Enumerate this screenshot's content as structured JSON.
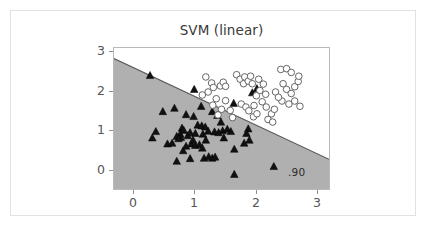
{
  "figure": {
    "background_color": "#ffffff",
    "frame_color": "#e2e2e2",
    "width": 427,
    "height": 227
  },
  "chart_data": {
    "type": "scatter",
    "title": "SVM (linear)",
    "subtitle": "",
    "xlabel": "",
    "ylabel": "",
    "xlim": [
      -0.45,
      3.25
    ],
    "ylim": [
      -0.6,
      3.15
    ],
    "xticks": [
      "0",
      "1",
      "2",
      "3"
    ],
    "xtick_values": [
      0,
      1,
      2,
      3
    ],
    "yticks": [
      "0",
      "1",
      "2",
      "3"
    ],
    "ytick_values": [
      0,
      1,
      2,
      3
    ],
    "grid": false,
    "legend": null,
    "annotations": [
      {
        "text": ".90",
        "x": 2.55,
        "y": -0.33,
        "role": "accuracy-score"
      }
    ],
    "decision_boundary": {
      "type": "line",
      "label": "linear decision boundary",
      "color": "#5a5a5a",
      "point_a": [
        -0.45,
        2.87
      ],
      "point_b": [
        3.25,
        0.19
      ],
      "slope": -0.7243,
      "intercept": 2.544
    },
    "regions": [
      {
        "name": "class-0-region",
        "fill_color": "#b0b0b0",
        "side": "below-left"
      },
      {
        "name": "class-1-region",
        "fill_color": "#ffffff",
        "side": "above-right"
      }
    ],
    "series": [
      {
        "name": "class-0",
        "marker": "triangle",
        "marker_color": "#111111",
        "marker_edge_color": "#000000",
        "points": [
          [
            0.17,
            2.42
          ],
          [
            0.93,
            2.05
          ],
          [
            0.39,
            1.46
          ],
          [
            0.59,
            1.55
          ],
          [
            1.05,
            1.6
          ],
          [
            0.79,
            1.38
          ],
          [
            0.92,
            1.33
          ],
          [
            1.24,
            1.46
          ],
          [
            1.33,
            1.36
          ],
          [
            1.61,
            1.68
          ],
          [
            1.39,
            1.18
          ],
          [
            0.27,
            0.93
          ],
          [
            0.21,
            0.76
          ],
          [
            0.47,
            0.6
          ],
          [
            0.55,
            0.62
          ],
          [
            0.72,
            1.02
          ],
          [
            0.75,
            0.96
          ],
          [
            0.69,
            0.86
          ],
          [
            0.82,
            0.82
          ],
          [
            0.86,
            0.9
          ],
          [
            0.95,
            0.88
          ],
          [
            0.99,
            1.1
          ],
          [
            1.06,
            1.08
          ],
          [
            1.12,
            1.05
          ],
          [
            1.17,
            0.94
          ],
          [
            1.28,
            0.92
          ],
          [
            1.42,
            0.95
          ],
          [
            1.5,
            0.99
          ],
          [
            1.56,
            0.93
          ],
          [
            1.86,
            1.0
          ],
          [
            1.83,
            0.88
          ],
          [
            1.88,
            0.7
          ],
          [
            1.79,
            0.62
          ],
          [
            1.62,
            0.46
          ],
          [
            0.63,
            0.14
          ],
          [
            0.74,
            0.42
          ],
          [
            0.79,
            0.54
          ],
          [
            0.88,
            0.6
          ],
          [
            0.95,
            0.56
          ],
          [
            1.02,
            0.58
          ],
          [
            1.07,
            0.49
          ],
          [
            1.1,
            0.22
          ],
          [
            1.18,
            0.26
          ],
          [
            1.24,
            0.22
          ],
          [
            1.29,
            0.25
          ],
          [
            0.86,
            0.21
          ],
          [
            0.7,
            0.77
          ],
          [
            0.63,
            0.8
          ],
          [
            0.66,
            0.74
          ],
          [
            1.62,
            -0.21
          ],
          [
            2.3,
            0.0
          ],
          [
            1.93,
            1.96
          ],
          [
            2.01,
            2.07
          ],
          [
            1.44,
            0.76
          ],
          [
            1.13,
            0.7
          ],
          [
            1.08,
            0.86
          ],
          [
            0.91,
            0.7
          ],
          [
            1.35,
            0.9
          ]
        ]
      },
      {
        "name": "class-1",
        "marker": "circle",
        "marker_color": "#ffffff",
        "marker_edge_color": "#666666",
        "points": [
          [
            1.13,
            2.38
          ],
          [
            1.23,
            2.22
          ],
          [
            1.26,
            2.1
          ],
          [
            1.17,
            1.98
          ],
          [
            1.38,
            2.14
          ],
          [
            1.43,
            2.24
          ],
          [
            1.47,
            2.13
          ],
          [
            1.31,
            1.8
          ],
          [
            1.25,
            1.63
          ],
          [
            1.4,
            1.52
          ],
          [
            1.34,
            1.37
          ],
          [
            1.47,
            1.75
          ],
          [
            1.55,
            1.49
          ],
          [
            1.66,
            2.44
          ],
          [
            1.72,
            2.32
          ],
          [
            1.8,
            2.38
          ],
          [
            1.78,
            2.2
          ],
          [
            1.86,
            2.27
          ],
          [
            1.93,
            2.2
          ],
          [
            1.9,
            2.4
          ],
          [
            1.74,
            1.66
          ],
          [
            1.82,
            1.58
          ],
          [
            1.87,
            1.48
          ],
          [
            1.96,
            1.62
          ],
          [
            2.04,
            2.32
          ],
          [
            2.12,
            2.19
          ],
          [
            2.06,
            2.02
          ],
          [
            2.0,
            1.88
          ],
          [
            2.1,
            1.72
          ],
          [
            2.17,
            1.58
          ],
          [
            2.26,
            1.4
          ],
          [
            2.31,
            1.52
          ],
          [
            2.2,
            1.25
          ],
          [
            2.28,
            1.18
          ],
          [
            2.42,
            2.58
          ],
          [
            2.52,
            2.6
          ],
          [
            2.6,
            2.5
          ],
          [
            2.46,
            2.2
          ],
          [
            2.52,
            2.05
          ],
          [
            2.6,
            1.94
          ],
          [
            2.66,
            2.12
          ],
          [
            2.72,
            2.26
          ],
          [
            2.44,
            1.74
          ],
          [
            2.56,
            1.66
          ],
          [
            2.66,
            1.74
          ],
          [
            2.75,
            1.6
          ],
          [
            2.33,
            1.98
          ],
          [
            2.38,
            1.84
          ],
          [
            1.59,
            1.3
          ],
          [
            2.73,
            2.4
          ],
          [
            2.16,
            1.92
          ],
          [
            1.07,
            1.9
          ],
          [
            1.95,
            1.32
          ],
          [
            2.01,
            1.4
          ]
        ]
      }
    ]
  }
}
